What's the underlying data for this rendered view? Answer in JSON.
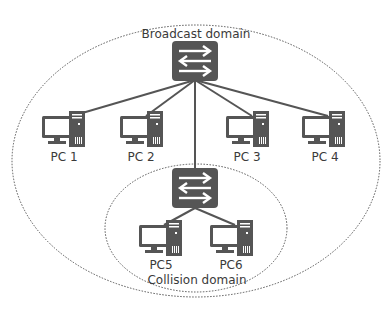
{
  "colors": {
    "device": "#555555",
    "device_detail": "#ffffff",
    "link": "#555555",
    "domain_border": "#555555",
    "text": "#3a3a3a"
  },
  "domains": {
    "broadcast": {
      "label": "Broadcast domain"
    },
    "collision": {
      "label": "Collision domain"
    }
  },
  "devices": {
    "switches": [
      {
        "id": "switch-top",
        "icon": "switch-icon"
      },
      {
        "id": "switch-bottom",
        "icon": "switch-icon"
      }
    ],
    "pcs": [
      {
        "label": "PC 1",
        "icon": "pc-icon"
      },
      {
        "label": "PC 2",
        "icon": "pc-icon"
      },
      {
        "label": "PC 3",
        "icon": "pc-icon"
      },
      {
        "label": "PC 4",
        "icon": "pc-icon"
      },
      {
        "label": "PC5",
        "icon": "pc-icon"
      },
      {
        "label": "PC6",
        "icon": "pc-icon"
      }
    ]
  },
  "links": [
    {
      "from": "switch-top",
      "to": "PC 1"
    },
    {
      "from": "switch-top",
      "to": "PC 2"
    },
    {
      "from": "switch-top",
      "to": "PC 3"
    },
    {
      "from": "switch-top",
      "to": "PC 4"
    },
    {
      "from": "switch-top",
      "to": "switch-bottom"
    },
    {
      "from": "switch-bottom",
      "to": "PC5"
    },
    {
      "from": "switch-bottom",
      "to": "PC6"
    }
  ]
}
